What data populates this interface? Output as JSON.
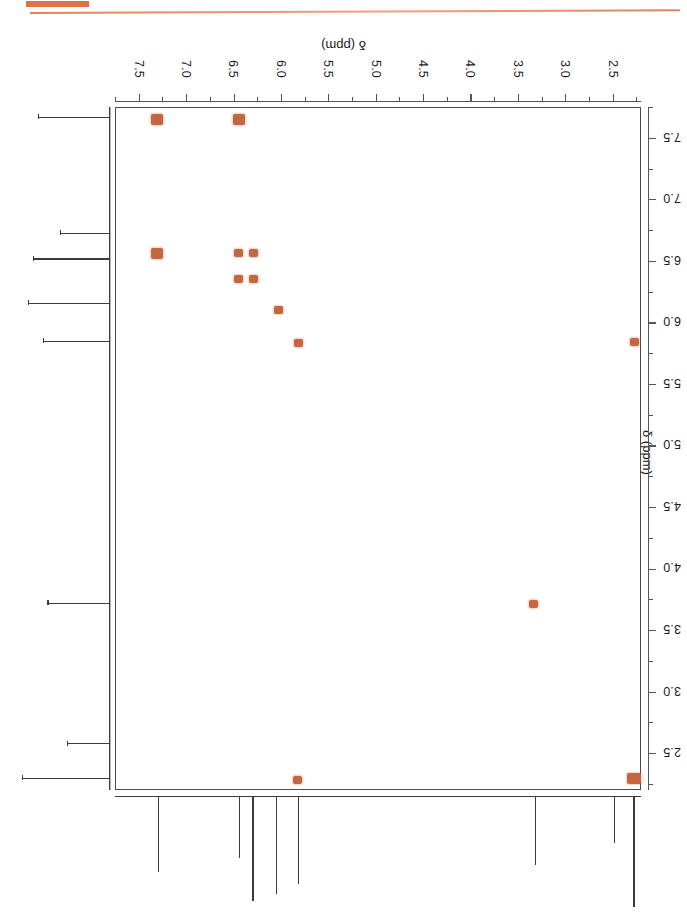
{
  "page": {
    "header_accent_color": "#e0714a",
    "caption": "COSY",
    "peak_color": "#c4663f",
    "axis_color": "#555555"
  },
  "chart_data": {
    "type": "scatter",
    "title": "COSY",
    "subtitle": "2D homonuclear correlation NMR spectrum",
    "orientation": "rotated-180",
    "xlabel": "δ (ppm)",
    "ylabel": "δ (ppm)",
    "xlim": [
      7.75,
      2.2
    ],
    "ylim": [
      7.75,
      2.2
    ],
    "grid": false,
    "legend": null,
    "x_ticks": [
      "2.5",
      "3.0",
      "3.5",
      "4.0",
      "4.5",
      "5.0",
      "5.5",
      "6.0",
      "6.5",
      "7.0",
      "7.5"
    ],
    "y_ticks": [
      "2.5",
      "3.0",
      "3.5",
      "4.0",
      "4.5",
      "5.0",
      "5.5",
      "6.0",
      "6.5",
      "7.0",
      "7.5"
    ],
    "x_tick_values": [
      2.5,
      3.0,
      3.5,
      4.0,
      4.5,
      5.0,
      5.5,
      6.0,
      6.5,
      7.0,
      7.5
    ],
    "y_tick_values": [
      2.5,
      3.0,
      3.5,
      4.0,
      4.5,
      5.0,
      5.5,
      6.0,
      6.5,
      7.0,
      7.5
    ],
    "minor_tick_step": 0.25,
    "points": [
      {
        "x": 2.28,
        "y": 2.3,
        "kind": "diagonal",
        "size": "large"
      },
      {
        "x": 5.83,
        "y": 2.29,
        "kind": "cross",
        "size": "small"
      },
      {
        "x": 3.35,
        "y": 3.72,
        "kind": "diagonal",
        "size": "small"
      },
      {
        "x": 2.28,
        "y": 5.85,
        "kind": "diagonal",
        "size": "small"
      },
      {
        "x": 5.82,
        "y": 5.84,
        "kind": "diagonal",
        "size": "small"
      },
      {
        "x": 6.04,
        "y": 6.11,
        "kind": "diagonal",
        "size": "small"
      },
      {
        "x": 6.3,
        "y": 6.36,
        "kind": "cross",
        "size": "small"
      },
      {
        "x": 6.46,
        "y": 6.36,
        "kind": "cross",
        "size": "small"
      },
      {
        "x": 6.3,
        "y": 6.57,
        "kind": "cross",
        "size": "small"
      },
      {
        "x": 6.46,
        "y": 6.57,
        "kind": "diagonal",
        "size": "small"
      },
      {
        "x": 7.32,
        "y": 6.57,
        "kind": "cross",
        "size": "medium"
      },
      {
        "x": 6.45,
        "y": 7.66,
        "kind": "cross",
        "size": "medium"
      },
      {
        "x": 7.32,
        "y": 7.66,
        "kind": "diagonal",
        "size": "medium"
      }
    ],
    "projection_f2_peaks": [
      {
        "ppm": 2.28,
        "height": 1.0
      },
      {
        "ppm": 2.49,
        "height": 0.42
      },
      {
        "ppm": 3.32,
        "height": 0.62
      },
      {
        "ppm": 5.82,
        "height": 0.79
      },
      {
        "ppm": 6.05,
        "height": 0.88
      },
      {
        "ppm": 6.3,
        "height": 0.95
      },
      {
        "ppm": 6.44,
        "height": 0.56
      },
      {
        "ppm": 7.3,
        "height": 0.68
      }
    ],
    "projection_f1_peaks": [
      {
        "ppm": 2.3,
        "height": 0.92
      },
      {
        "ppm": 2.58,
        "height": 0.45
      },
      {
        "ppm": 3.72,
        "height": 0.65
      },
      {
        "ppm": 5.85,
        "height": 0.7
      },
      {
        "ppm": 6.16,
        "height": 0.85
      },
      {
        "ppm": 6.52,
        "height": 0.8
      },
      {
        "ppm": 6.73,
        "height": 0.52
      },
      {
        "ppm": 7.67,
        "height": 0.75
      }
    ]
  }
}
